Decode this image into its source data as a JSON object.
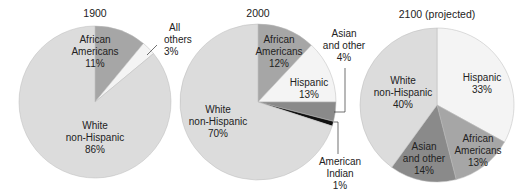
{
  "chart_data": [
    {
      "type": "pie",
      "title": "1900",
      "slices": [
        {
          "label": "African Americans",
          "value": 11,
          "color": "#a6a6a6"
        },
        {
          "label": "All others",
          "value": 3,
          "color": "#f4f4f4"
        },
        {
          "label": "White non-Hispanic",
          "value": 86,
          "color": "#dcdcdc"
        }
      ]
    },
    {
      "type": "pie",
      "title": "2000",
      "slices": [
        {
          "label": "African Americans",
          "value": 12,
          "color": "#a6a6a6"
        },
        {
          "label": "Hispanic",
          "value": 13,
          "color": "#f4f4f4"
        },
        {
          "label": "Asian and other",
          "value": 4,
          "color": "#8a8a8a"
        },
        {
          "label": "American Indian",
          "value": 1,
          "color": "#111111"
        },
        {
          "label": "White non-Hispanic",
          "value": 70,
          "color": "#dcdcdc"
        }
      ]
    },
    {
      "type": "pie",
      "title": "2100 (projected)",
      "slices": [
        {
          "label": "Hispanic",
          "value": 33,
          "color": "#f4f4f4"
        },
        {
          "label": "African Americans",
          "value": 13,
          "color": "#a6a6a6"
        },
        {
          "label": "Asian and other",
          "value": 14,
          "color": "#8a8a8a"
        },
        {
          "label": "White non-Hispanic",
          "value": 40,
          "color": "#dcdcdc"
        }
      ]
    }
  ],
  "labels": {
    "p1": {
      "title": "1900",
      "aa1": "African",
      "aa2": "Americans",
      "aa3": "11%",
      "ao1": "All",
      "ao2": "others",
      "ao3": "3%",
      "w1": "White",
      "w2": "non-Hispanic",
      "w3": "86%"
    },
    "p2": {
      "title": "2000",
      "aa1": "African",
      "aa2": "Americans",
      "aa3": "12%",
      "h1": "Hispanic",
      "h2": "13%",
      "as1": "Asian",
      "as2": "and other",
      "as3": "4%",
      "ai1": "American",
      "ai2": "Indian",
      "ai3": "1%",
      "w1": "White",
      "w2": "non-Hispanic",
      "w3": "70%"
    },
    "p3": {
      "title": "2100 (projected)",
      "h1": "Hispanic",
      "h2": "33%",
      "aa1": "African",
      "aa2": "Americans",
      "aa3": "13%",
      "as1": "Asian",
      "as2": "and other",
      "as3": "14%",
      "w1": "White",
      "w2": "non-Hispanic",
      "w3": "40%"
    }
  }
}
